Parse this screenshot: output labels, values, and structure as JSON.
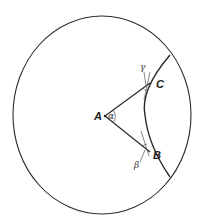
{
  "diagram": {
    "type": "geometry",
    "colors": {
      "stroke": "#2a2a2a",
      "background": "#ffffff"
    },
    "outer_circle": {
      "cx": 102,
      "cy": 115,
      "rx": 89,
      "ry": 99
    },
    "points": {
      "A": {
        "label": "A",
        "x": 105,
        "y": 116
      },
      "B": {
        "label": "B",
        "x": 150,
        "y": 152
      },
      "C": {
        "label": "C",
        "x": 150,
        "y": 83
      }
    },
    "angles": {
      "alpha": {
        "label": "α",
        "vertex": "A"
      },
      "beta": {
        "label": "β",
        "vertex": "B"
      },
      "gamma": {
        "label": "γ",
        "vertex": "C"
      }
    }
  }
}
